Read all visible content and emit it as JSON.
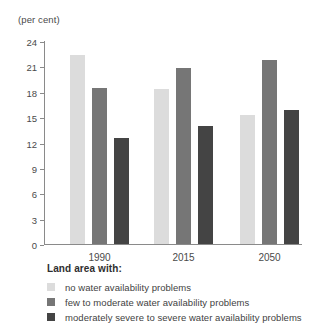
{
  "chart_data": {
    "type": "bar",
    "title": "",
    "subtitle": "",
    "units_label": "(per cent)",
    "xlabel": "",
    "ylabel": "",
    "ylim": [
      0,
      24
    ],
    "yticks": [
      0,
      3,
      6,
      9,
      12,
      15,
      18,
      21,
      24
    ],
    "ytick_labels": [
      "0",
      "3",
      "6",
      "9",
      "12",
      "15",
      "18",
      "21",
      "24"
    ],
    "grid": false,
    "legend_position": "below",
    "legend_title": "Land area with:",
    "categories": [
      "1990",
      "2015",
      "2050"
    ],
    "series": [
      {
        "name": "no water availability problems",
        "color": "#dcdcdc",
        "values": [
          22.3,
          18.3,
          15.3
        ]
      },
      {
        "name": "few to moderate water availability problems",
        "color": "#767676",
        "values": [
          18.5,
          20.8,
          21.7
        ]
      },
      {
        "name": "moderately severe to severe water availability problems",
        "color": "#444444",
        "values": [
          12.5,
          14.0,
          15.8
        ]
      }
    ]
  }
}
